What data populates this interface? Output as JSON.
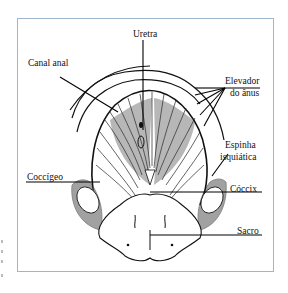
{
  "figure": {
    "type": "anatomical line drawing",
    "frame_color": "#9fb6cf",
    "labels": [
      {
        "id": "uretra",
        "text": "Uretra"
      },
      {
        "id": "canal_anal",
        "text": "Canal anal"
      },
      {
        "id": "elevador_line1",
        "text": "Elevador"
      },
      {
        "id": "elevador_line2",
        "text": "do ânus"
      },
      {
        "id": "espinha_line1",
        "text": "Espinha"
      },
      {
        "id": "espinha_line2",
        "text": "isquiática"
      },
      {
        "id": "coccigeo",
        "text": "Coccígeo"
      },
      {
        "id": "coccix",
        "text": "Cóccix"
      },
      {
        "id": "sacro",
        "text": "Sacro"
      }
    ]
  }
}
